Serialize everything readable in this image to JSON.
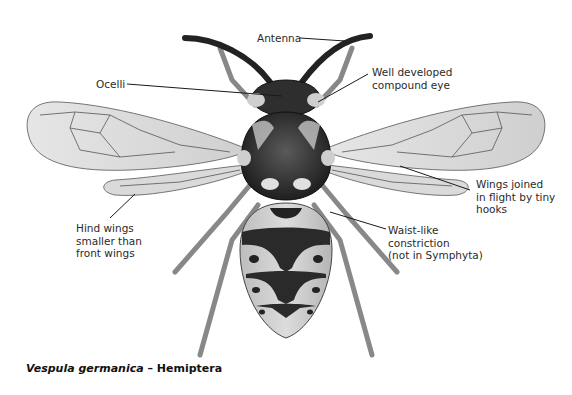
{
  "figure": {
    "caption": {
      "species": "Vespula germanica",
      "separator": " – ",
      "order": "Hemiptera"
    },
    "labels": [
      {
        "id": "antenna",
        "text": "Antenna"
      },
      {
        "id": "ocelli",
        "text": "Ocelli"
      },
      {
        "id": "compound-eye",
        "lines": [
          "Well developed",
          "compound eye"
        ]
      },
      {
        "id": "wings-joined",
        "lines": [
          "Wings joined",
          "in flight by tiny",
          "hooks"
        ]
      },
      {
        "id": "hind-wings",
        "lines": [
          "Hind wings",
          "smaller than",
          "front wings"
        ]
      },
      {
        "id": "waist",
        "lines": [
          "Waist-like",
          "constriction",
          "(not in Symphyta)"
        ]
      }
    ]
  }
}
